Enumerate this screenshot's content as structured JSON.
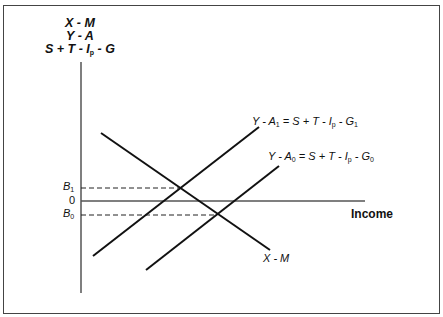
{
  "figure": {
    "y_axis_label": {
      "line1": "X - M",
      "line2": "Y - A",
      "line3_pre": "S + T - I",
      "line3_sub": "p",
      "line3_post": " - G"
    },
    "x_axis_label": "Income",
    "ticks": {
      "b1": "B",
      "b1_sub": "1",
      "zero": "0",
      "b0": "B",
      "b0_sub": "0"
    },
    "curves": {
      "ya1": {
        "lhs": "Y - A",
        "lhs_sub": "1",
        "eq": " = S + T - I",
        "ip_sub": "p",
        "rhs": " - G",
        "rhs_sub": "1"
      },
      "ya0": {
        "lhs": "Y - A",
        "lhs_sub": "0",
        "eq": " = S + T - I",
        "ip_sub": "p",
        "rhs": " - G",
        "rhs_sub": "0"
      },
      "xm": {
        "label": "X - M"
      }
    },
    "colors": {
      "line": "#111111",
      "axis": "#555555",
      "frame": "#444444"
    }
  }
}
